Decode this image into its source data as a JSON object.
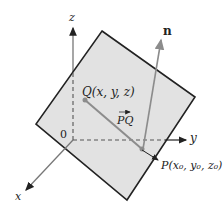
{
  "diagram": {
    "type": "3d-plane-vector-figure",
    "axes": {
      "z": "z",
      "y": "y",
      "x": "x",
      "origin": "0"
    },
    "points": {
      "Q": "Q(x, y, z)",
      "P": "P(x₀, y₀, z₀)"
    },
    "vectors": {
      "PQ": "PQ",
      "normal": "n"
    },
    "colors": {
      "plane_fill": "#e2e2e2",
      "plane_edge": "#222222",
      "vector": "#8c8c8c",
      "axis": "#555555"
    }
  }
}
